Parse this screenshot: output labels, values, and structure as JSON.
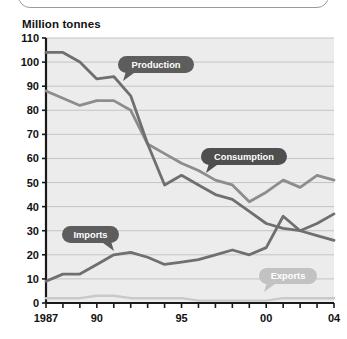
{
  "page": {
    "background_color": "#ffffff",
    "top_panel_present": true
  },
  "chart_title": "Million tonnes",
  "chart_data": {
    "type": "line",
    "title": "Million tonnes",
    "xlabel": "",
    "ylabel": "Million tonnes",
    "ylim": [
      0,
      110
    ],
    "ytick_step": 10,
    "grid": true,
    "legend_position": "inline-callouts",
    "x": [
      1987,
      1988,
      1989,
      1990,
      1991,
      1992,
      1993,
      1994,
      1995,
      1996,
      1997,
      1998,
      1999,
      2000,
      2001,
      2002,
      2003,
      2004
    ],
    "categories": [
      "1987",
      "1988",
      "1989",
      "1990",
      "1991",
      "1992",
      "1993",
      "1994",
      "1995",
      "1996",
      "1997",
      "1998",
      "1999",
      "2000",
      "2001",
      "2002",
      "2003",
      "2004"
    ],
    "xtick_labels": [
      "1987",
      "90",
      "95",
      "00",
      "04"
    ],
    "xtick_label_positions": [
      1987,
      1990,
      1995,
      2000,
      2004
    ],
    "ytick_labels": [
      "0",
      "10",
      "20",
      "30",
      "40",
      "50",
      "60",
      "70",
      "80",
      "90",
      "100",
      "110"
    ],
    "series": [
      {
        "name": "Production",
        "color": "#6f6f6f",
        "values": [
          104,
          104,
          100,
          93,
          94,
          86,
          66,
          49,
          53,
          49,
          45,
          43,
          38,
          33,
          31,
          30,
          28,
          26
        ]
      },
      {
        "name": "Consumption",
        "color": "#8d8d8d",
        "values": [
          88,
          85,
          82,
          84,
          84,
          80,
          66,
          62,
          58,
          55,
          51,
          49,
          42,
          46,
          51,
          48,
          53,
          51
        ]
      },
      {
        "name": "Imports",
        "color": "#6f6f6f",
        "values": [
          9,
          12,
          12,
          16,
          20,
          21,
          19,
          16,
          17,
          18,
          20,
          22,
          20,
          23,
          36,
          30,
          33,
          37
        ]
      },
      {
        "name": "Exports",
        "color": "#c9c9c9",
        "values": [
          2,
          2,
          2,
          3,
          3,
          2,
          2,
          2,
          2,
          1,
          1,
          1,
          1,
          1,
          2,
          2,
          2,
          2
        ]
      }
    ]
  },
  "callouts": [
    {
      "label": "Production",
      "color": "#5d5d5d",
      "text_color": "#ffffff"
    },
    {
      "label": "Consumption",
      "color": "#4f4f4f",
      "text_color": "#ffffff"
    },
    {
      "label": "Imports",
      "color": "#5d5d5d",
      "text_color": "#ffffff"
    },
    {
      "label": "Exports",
      "color": "#c2c2c2",
      "text_color": "#ffffff"
    }
  ],
  "colors": {
    "plot_background": "#ececec",
    "gridline": "#c4c4c4",
    "axis": "#1a1a1a",
    "production": "#6f6f6f",
    "consumption": "#8d8d8d",
    "imports": "#6f6f6f",
    "exports": "#c9c9c9"
  }
}
